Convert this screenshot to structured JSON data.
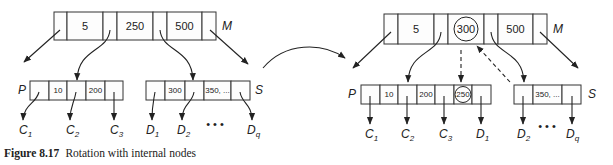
{
  "figure": {
    "number": "Figure 8.17",
    "title": "Rotation with internal nodes"
  },
  "before": {
    "M": {
      "label": "M",
      "keys": [
        "5",
        "250",
        "500"
      ]
    },
    "P": {
      "label": "P",
      "keys": [
        "10",
        "200"
      ]
    },
    "S": {
      "label": "S",
      "keys": [
        "300",
        "350, ..."
      ]
    },
    "children_P": [
      {
        "base": "C",
        "sub": "1"
      },
      {
        "base": "C",
        "sub": "2"
      },
      {
        "base": "C",
        "sub": "3"
      }
    ],
    "children_S": [
      {
        "base": "D",
        "sub": "1"
      },
      {
        "base": "D",
        "sub": "2"
      },
      {
        "base": "D",
        "sub": "q"
      }
    ],
    "ellipsis": "• • •"
  },
  "after": {
    "M": {
      "label": "M",
      "keys": [
        "5",
        "300",
        "500"
      ],
      "circled_key": "300"
    },
    "P": {
      "label": "P",
      "keys": [
        "10",
        "200",
        "250"
      ],
      "circled_key": "250"
    },
    "S": {
      "label": "S",
      "keys": [
        "350, ..."
      ]
    },
    "children_P": [
      {
        "base": "C",
        "sub": "1"
      },
      {
        "base": "C",
        "sub": "2"
      },
      {
        "base": "C",
        "sub": "3"
      },
      {
        "base": "D",
        "sub": "1"
      }
    ],
    "children_S": [
      {
        "base": "D",
        "sub": "2"
      },
      {
        "base": "D",
        "sub": "q"
      }
    ],
    "ellipsis": "• • •"
  }
}
